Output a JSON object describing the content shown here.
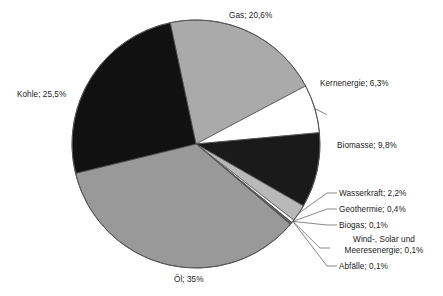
{
  "chart_data": {
    "type": "pie",
    "title": "",
    "subtitle": "",
    "xlabel": "",
    "ylabel": "",
    "legend": "none",
    "grid": false,
    "label_format": "name; value% (German decimal comma)",
    "start_angle_deg": -12,
    "direction": "clockwise",
    "center": [
      196,
      144
    ],
    "radius": 124,
    "categories": [
      "Gas",
      "Kernenergie",
      "Biomasse",
      "Wasserkraft",
      "Geothermie",
      "Biogas",
      "Wind-, Solar und Meeresenergie",
      "Abfälle",
      "Öl",
      "Kohle"
    ],
    "values": [
      20.6,
      6.3,
      9.8,
      2.2,
      0.4,
      0.1,
      0.1,
      0.1,
      35,
      25.5
    ],
    "value_labels": [
      "20,6%",
      "6,3%",
      "9,8%",
      "2,2%",
      "0,4%",
      "0,1%",
      "0,1%",
      "0,1%",
      "35%",
      "25,5%"
    ],
    "colors": [
      "#aaaaaa",
      "#ffffff",
      "#1a1a1a",
      "#b9b9b9",
      "#ffffff",
      "#1a1a1a",
      "#ffffff",
      "#1a1a1a",
      "#999999",
      "#111111"
    ],
    "slices": [
      {
        "name": "Gas",
        "value": 20.6,
        "label": "Gas; 20,6%",
        "color": "#aaaaaa",
        "leader": false
      },
      {
        "name": "Kernenergie",
        "value": 6.3,
        "label": "Kernenergie; 6,3%",
        "color": "#ffffff",
        "leader": true
      },
      {
        "name": "Biomasse",
        "value": 9.8,
        "label": "Biomasse; 9,8%",
        "color": "#1a1a1a",
        "leader": false
      },
      {
        "name": "Wasserkraft",
        "value": 2.2,
        "label": "Wasserkraft; 2,2%",
        "color": "#b9b9b9",
        "leader": true
      },
      {
        "name": "Geothermie",
        "value": 0.4,
        "label": "Geothermie; 0,4%",
        "color": "#ffffff",
        "leader": true
      },
      {
        "name": "Biogas",
        "value": 0.1,
        "label": "Biogas; 0,1%",
        "color": "#1a1a1a",
        "leader": true
      },
      {
        "name": "Wind-, Solar und Meeresenergie",
        "value": 0.1,
        "label": "Wind-, Solar und Meeresenergie; 0,1%",
        "color": "#ffffff",
        "leader": true
      },
      {
        "name": "Abfälle",
        "value": 0.1,
        "label": "Abfälle; 0,1%",
        "color": "#1a1a1a",
        "leader": true
      },
      {
        "name": "Öl",
        "value": 35,
        "label": "Öl; 35%",
        "color": "#999999",
        "leader": false
      },
      {
        "name": "Kohle",
        "value": 25.5,
        "label": "Kohle; 25,5%",
        "color": "#111111",
        "leader": false
      }
    ]
  },
  "labels": {
    "gas": "Gas; 20,6%",
    "kernenergie": "Kernenergie; 6,3%",
    "biomasse": "Biomasse; 9,8%",
    "wasserkraft": "Wasserkraft; 2,2%",
    "geothermie": "Geothermie; 0,4%",
    "biogas": "Biogas; 0,1%",
    "windsolar_line1": "Wind-, Solar und",
    "windsolar_line2": "Meeresenergie; 0,1%",
    "abfaelle": "Abfälle; 0,1%",
    "oel": "Öl; 35%",
    "kohle": "Kohle; 25,5%"
  },
  "style": {
    "outline_color": "#555555",
    "text_color": "#1a1a1a",
    "background": "#ffffff"
  }
}
